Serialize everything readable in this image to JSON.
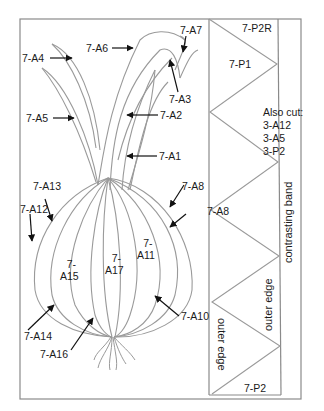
{
  "diagram": {
    "colors": {
      "line": "#9a9a9a",
      "frame": "#888888",
      "text": "#1a1a1a",
      "arrow": "#111111"
    },
    "onion_labels": {
      "a1": "7-A1",
      "a2": "7-A2",
      "a3": "7-A3",
      "a4": "7-A4",
      "a5": "7-A5",
      "a6": "7-A6",
      "a7": "7-A7",
      "a8": "7-A8",
      "a10": "7-A10",
      "a11_l1": "7-",
      "a11_l2": "A11",
      "a12": "7-A12",
      "a13": "7-A13",
      "a14": "7-A14",
      "a15_l1": "7-",
      "a15_l2": "A15",
      "a16": "7-A16",
      "a17_l1": "7-",
      "a17_l2": "A17"
    },
    "strip_labels": {
      "p2r": "7-P2R",
      "p1": "7-P1",
      "a8_strip": "7-A8",
      "p2": "7-P2",
      "also_cut_title": "Also cut:",
      "also_cut_items": [
        "3-A12",
        "3-A5",
        "3-P2"
      ],
      "outer_edge_1": "outer edge",
      "outer_edge_2": "outer edge",
      "contrasting_band": "contrasting band"
    }
  }
}
